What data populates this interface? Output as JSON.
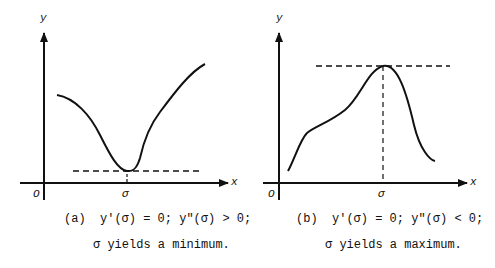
{
  "panels": [
    {
      "id": "a",
      "y_label": "y",
      "x_label": "x",
      "origin_label": "O",
      "point_label": "σ",
      "caption_line1": "(a)  y'(σ) = 0; y\"(σ) > 0;",
      "caption_line2": "σ yields a minimum.",
      "extremum": "minimum"
    },
    {
      "id": "b",
      "y_label": "y",
      "x_label": "x",
      "origin_label": "O",
      "point_label": "σ",
      "caption_line1": "(b)  y'(σ) = 0; y\"(σ) < 0;",
      "caption_line2": "σ yields a maximum.",
      "extremum": "maximum"
    }
  ],
  "colors": {
    "ink": "#111111",
    "background": "#ffffff"
  }
}
